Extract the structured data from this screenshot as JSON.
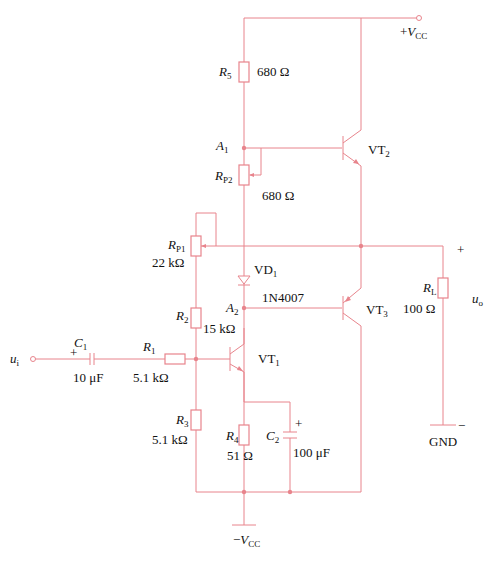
{
  "colors": {
    "wire": "#e8848c",
    "text": "#111111",
    "background": "#ffffff"
  },
  "supplies": {
    "vcc_pos": {
      "sign": "+",
      "symbol": "V",
      "sub": "CC"
    },
    "vcc_neg": {
      "sign": "−",
      "symbol": "V",
      "sub": "CC"
    },
    "gnd": "GND"
  },
  "input": {
    "symbol": "u",
    "sub": "i"
  },
  "output": {
    "symbol": "u",
    "sub": "o",
    "plus": "+",
    "minus": "−"
  },
  "components": {
    "R5": {
      "symbol": "R",
      "sub": "5",
      "value": "680 Ω"
    },
    "RP2": {
      "symbol": "R",
      "sub": "P2",
      "value": "680 Ω"
    },
    "RP1": {
      "symbol": "R",
      "sub": "P1",
      "value": "22 kΩ"
    },
    "R2": {
      "symbol": "R",
      "sub": "2",
      "value": "15 kΩ"
    },
    "R1": {
      "symbol": "R",
      "sub": "1",
      "value": "5.1 kΩ"
    },
    "R3": {
      "symbol": "R",
      "sub": "3",
      "value": "5.1 kΩ"
    },
    "R4": {
      "symbol": "R",
      "sub": "4",
      "value": "51 Ω"
    },
    "RL": {
      "symbol": "R",
      "sub": "L",
      "value": "100 Ω"
    },
    "C1": {
      "symbol": "C",
      "sub": "1",
      "value": "10 μF",
      "polarity": "+"
    },
    "C2": {
      "symbol": "C",
      "sub": "2",
      "value": "100 μF",
      "polarity": "+"
    },
    "VD1": {
      "symbol": "VD",
      "sub": "1",
      "part": "1N4007"
    },
    "VT1": {
      "symbol": "VT",
      "sub": "1"
    },
    "VT2": {
      "symbol": "VT",
      "sub": "2"
    },
    "VT3": {
      "symbol": "VT",
      "sub": "3"
    }
  },
  "nodes": {
    "A1": {
      "symbol": "A",
      "sub": "1"
    },
    "A2": {
      "symbol": "A",
      "sub": "2"
    }
  }
}
